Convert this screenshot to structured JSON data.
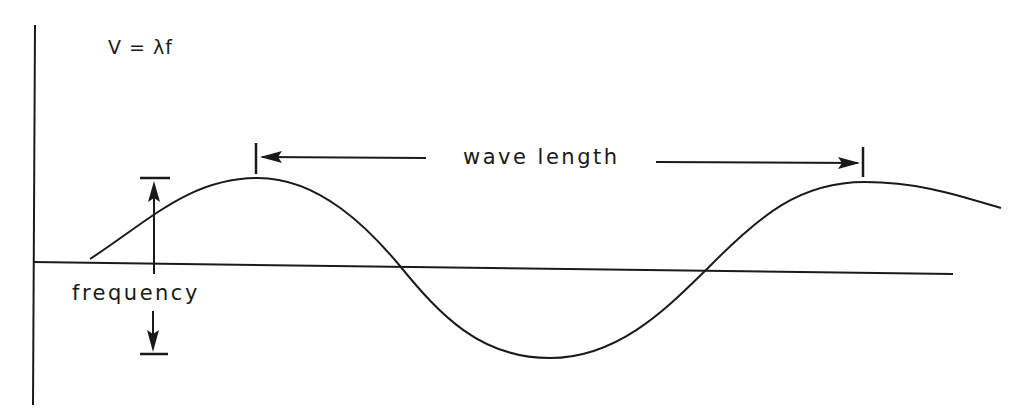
{
  "diagram": {
    "formula": "V = λf",
    "wavelength_label": "wave length",
    "frequency_label": "frequency",
    "colors": {
      "ink": "#1a1a1a",
      "background": "#ffffff"
    }
  }
}
